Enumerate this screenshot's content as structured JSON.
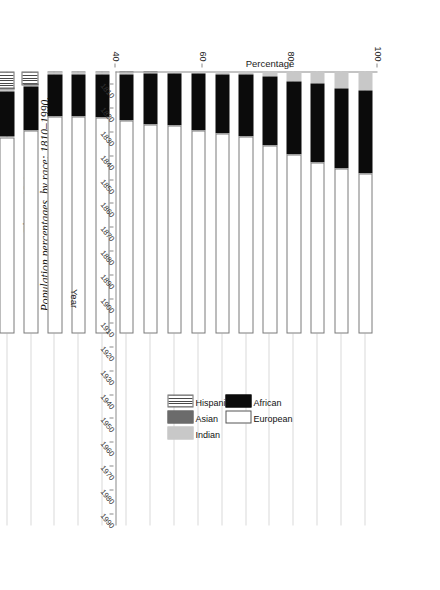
{
  "figure": {
    "number": "Figure 12.1",
    "caption": "Population percentages, by race: 1810–1990."
  },
  "chart_data": {
    "type": "bar",
    "subtype": "stacked-horizontal",
    "title": "Population percentages, by race: 1810–1990.",
    "xlabel": "Year",
    "ylabel": "Percentage",
    "ylim": [
      40,
      100
    ],
    "yticks": [
      100,
      80,
      60,
      40
    ],
    "ytick_labels": [
      "100",
      "80",
      "60",
      "40"
    ],
    "grid": "horizontal-category-lines",
    "orientation": "chart rotated 90° clockwise on the page",
    "stack_order_from_100": [
      "Hispanic",
      "Asian",
      "Indian",
      "African",
      "European"
    ],
    "categories": [
      "1810",
      "1820",
      "1830",
      "1840",
      "1850",
      "1860",
      "1870",
      "1880",
      "1890",
      "1900",
      "1910",
      "1920",
      "1930",
      "1940",
      "1950",
      "1960",
      "1970",
      "1980",
      "1990"
    ],
    "series": [
      {
        "name": "Hispanic",
        "color": "#4a4a4a",
        "pattern": "vertical-stripes",
        "values": [
          0,
          0,
          0,
          0,
          0,
          0,
          0,
          0,
          0,
          0,
          0,
          0,
          0,
          0,
          2.7,
          3.6,
          4.6,
          6.1,
          8.5
        ]
      },
      {
        "name": "Asian",
        "color": "#6b6b6b",
        "pattern": "solid",
        "values": [
          0,
          0,
          0,
          0,
          0,
          0,
          0,
          0,
          0,
          0.2,
          0.3,
          0.3,
          0.3,
          0.3,
          0.4,
          0.6,
          0.8,
          1.8,
          3.0
        ]
      },
      {
        "name": "Indian",
        "color": "#c8c8c8",
        "pattern": "solid",
        "values": [
          4.3,
          3.8,
          2.8,
          2.2,
          1.2,
          0.8,
          0.6,
          0.5,
          0.4,
          0.3,
          0.3,
          0.3,
          0.3,
          0.3,
          0.3,
          0.3,
          0.4,
          0.6,
          0.8
        ]
      },
      {
        "name": "African",
        "color": "#0b0b0b",
        "pattern": "solid",
        "values": [
          19.0,
          18.4,
          18.1,
          16.8,
          15.7,
          14.1,
          13.5,
          13.1,
          11.9,
          11.6,
          10.7,
          9.9,
          9.7,
          9.8,
          10.0,
          10.5,
          11.1,
          11.7,
          12.1
        ]
      },
      {
        "name": "European",
        "color": "#ffffff",
        "pattern": "solid",
        "values": [
          76.7,
          77.8,
          79.1,
          80.7,
          83.1,
          85.1,
          85.3,
          86.3,
          87.7,
          87.9,
          88.7,
          89.5,
          89.7,
          89.6,
          86.6,
          85.0,
          83.1,
          79.8,
          75.6
        ]
      }
    ],
    "legend": {
      "position": "inside upper-right of plot",
      "entries": [
        {
          "label": "African",
          "fill": "#0b0b0b"
        },
        {
          "label": "European",
          "fill": "#ffffff"
        },
        {
          "label": "Hispanic",
          "fill": "#4a4a4a"
        },
        {
          "label": "Asian",
          "fill": "#6b6b6b"
        },
        {
          "label": "Indian",
          "fill": "#c8c8c8"
        }
      ]
    }
  }
}
